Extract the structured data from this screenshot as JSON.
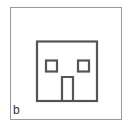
{
  "panel": {
    "label": "b",
    "figure": "square-face-icon",
    "colors": {
      "stroke": "#555555",
      "frame": "#9a9a9a",
      "background": "#ffffff"
    }
  }
}
